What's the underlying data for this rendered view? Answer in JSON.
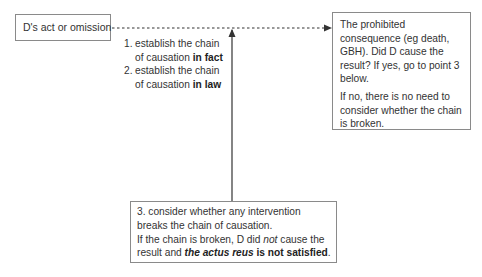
{
  "diagram": {
    "act_box": {
      "label": "D's act or omission"
    },
    "steps": [
      {
        "num": "1.",
        "text_line1": "establish the chain",
        "text_line2": "of causation ",
        "emphasis": "in fact"
      },
      {
        "num": "2.",
        "text_line1": "establish the chain",
        "text_line2": "of causation ",
        "emphasis": "in law"
      }
    ],
    "consequence_box": {
      "paragraph1": "The prohibited consequence (eg death, GBH). Did D cause the result? If yes, go to point 3 below.",
      "paragraph2": "If no, there is no need to consider whether the chain is broken."
    },
    "intervention_box": {
      "line1": "3. consider whether any intervention breaks the chain of causation.",
      "line2_a": "If the chain is broken, D did ",
      "line2_italic": "not",
      "line2_b": " cause the result and ",
      "line2_bold_italic": "the actus reus",
      "line2_bold": " is not satisfied",
      "line2_end": "."
    },
    "connectors": [
      {
        "type": "dashed-arrow",
        "from": "act_box",
        "to": "consequence_box"
      },
      {
        "type": "solid-arrow",
        "from": "intervention_box",
        "to": "dashed-line"
      }
    ],
    "colors": {
      "line": "#333333",
      "border": "#8a8a8a",
      "text": "#333333"
    }
  }
}
